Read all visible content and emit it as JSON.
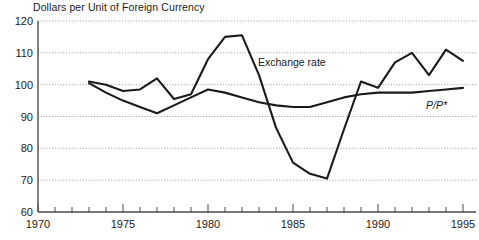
{
  "chart_data": {
    "type": "line",
    "title": "Dollars per Unit of Foreign Currency",
    "xlabel": "",
    "ylabel": "",
    "xlim": [
      1970,
      1995
    ],
    "ylim": [
      60,
      120
    ],
    "ytick_labels": [
      "60",
      "70",
      "80",
      "90",
      "100",
      "110",
      "120"
    ],
    "ytick_values": [
      60,
      70,
      80,
      90,
      100,
      110,
      120
    ],
    "xtick_labels": [
      "1970",
      "1975",
      "1980",
      "1985",
      "1990",
      "1995"
    ],
    "xtick_values": [
      1970,
      1975,
      1980,
      1985,
      1990,
      1995
    ],
    "xtick_minor_step": 1,
    "grid": "horizontal-dotted",
    "legend": "inline-annotations",
    "series": [
      {
        "name": "Exchange rate",
        "annotation": "Exchange rate",
        "x": [
          1973,
          1974,
          1975,
          1976,
          1977,
          1978,
          1979,
          1980,
          1981,
          1982,
          1983,
          1984,
          1985,
          1986,
          1987,
          1988,
          1989,
          1990,
          1991,
          1992,
          1993,
          1994,
          1995
        ],
        "values": [
          101,
          100,
          98,
          98.5,
          102,
          95.5,
          97,
          108,
          115,
          115.5,
          103,
          86.5,
          75.5,
          72,
          70.5,
          86,
          101,
          99,
          107,
          110,
          103,
          111,
          107.5
        ]
      },
      {
        "name": "P/P*",
        "annotation": "P/P*",
        "x": [
          1973,
          1974,
          1975,
          1976,
          1977,
          1978,
          1979,
          1980,
          1981,
          1982,
          1983,
          1984,
          1985,
          1986,
          1987,
          1988,
          1989,
          1990,
          1991,
          1992,
          1993,
          1994,
          1995
        ],
        "values": [
          100.5,
          97.5,
          95,
          93,
          91,
          93.5,
          96,
          98.5,
          97.5,
          96,
          94.5,
          93.5,
          93,
          93,
          94.5,
          96,
          97,
          97.5,
          97.5,
          97.5,
          98,
          98.5,
          99
        ]
      }
    ],
    "annotations": [
      {
        "text": "Exchange rate",
        "x_px": 258,
        "y_px": 66
      },
      {
        "text": "P/P*",
        "x_px": 426,
        "y_px": 109
      }
    ]
  }
}
